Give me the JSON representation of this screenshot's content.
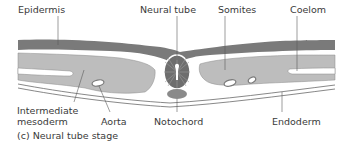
{
  "diagram": {
    "labels": {
      "epidermis": "Epidermis",
      "neural_tube": "Neural tube",
      "somites": "Somites",
      "coelom": "Coelom",
      "intermediate_mesoderm_1": "Intermediate",
      "intermediate_mesoderm_2": "mesoderm",
      "aorta": "Aorta",
      "notochord": "Notochord",
      "endoderm": "Endoderm"
    },
    "caption": "(c) Neural tube stage",
    "colors": {
      "epidermis": "#7a7a7a",
      "mesoderm": "#bdbdbd",
      "neural_tube": "#6e6e6e",
      "notochord": "#8a8a8a",
      "outline": "#6a6a6a",
      "text": "#3a3a3a"
    }
  }
}
